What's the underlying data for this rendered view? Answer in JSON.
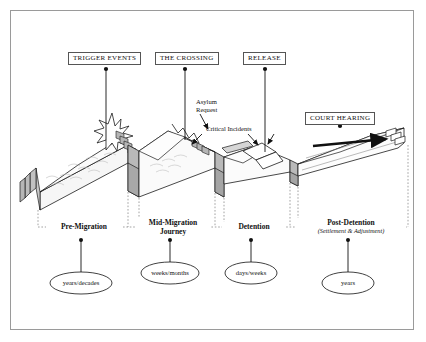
{
  "diagram": {
    "background_color": "#ffffff",
    "border_color": "#9a9a9a",
    "terrain_fill": "#f4f4f4",
    "wall_fill": "#b9b9b9",
    "line_color": "#1a1a1a"
  },
  "event_markers": [
    {
      "id": "trigger-events",
      "label": "TRIGGER EVENTS",
      "box_x": 68,
      "box_y": 52,
      "dot_x": 106,
      "dot_y": 68,
      "line_to_y": 140
    },
    {
      "id": "the-crossing",
      "label": "THE CROSSING",
      "box_x": 155,
      "box_y": 52,
      "dot_x": 185,
      "dot_y": 68,
      "line_to_y": 140
    },
    {
      "id": "release",
      "label": "RELEASE",
      "box_x": 243,
      "box_y": 52,
      "dot_x": 265,
      "dot_y": 68,
      "line_to_y": 152
    },
    {
      "id": "court-hearing",
      "label": "COURT HEARING",
      "box_x": 305,
      "box_y": 112,
      "dot_x": 340,
      "dot_y": 127,
      "line_to_y": 127
    }
  ],
  "annotations": [
    {
      "id": "asylum-request",
      "label_line1": "Asylum",
      "label_line2": "Request",
      "x": 196,
      "y": 100
    },
    {
      "id": "critical-incidents",
      "label_line1": "Critical Incidents",
      "label_line2": "",
      "x": 205,
      "y": 128
    }
  ],
  "phases": [
    {
      "id": "pre-migration",
      "label": "Pre-Migration",
      "label_line2": "",
      "sublabel": "",
      "center_x": 81,
      "label_y": 226,
      "start_x": 38,
      "end_x": 124
    },
    {
      "id": "mid-migration",
      "label": "Mid-Migration",
      "label_line2": "Journey",
      "sublabel": "",
      "center_x": 170,
      "label_y": 222,
      "start_x": 124,
      "end_x": 217
    },
    {
      "id": "detention",
      "label": "Detention",
      "label_line2": "",
      "sublabel": "",
      "center_x": 251,
      "label_y": 226,
      "start_x": 217,
      "end_x": 287
    },
    {
      "id": "post-detention",
      "label": "Post-Detention",
      "label_line2": "",
      "sublabel": "(Settlement & Adjustment)",
      "center_x": 348,
      "label_y": 222,
      "start_x": 287,
      "end_x": 408
    }
  ],
  "durations": [
    {
      "id": "pre-migration-duration",
      "label": "years/decades",
      "cx": 81,
      "cy": 283,
      "rx": 31,
      "ry": 11,
      "stem_from_y": 240
    },
    {
      "id": "mid-migration-duration",
      "label": "weeks/months",
      "cx": 170,
      "cy": 273,
      "rx": 29,
      "ry": 11,
      "stem_from_y": 240
    },
    {
      "id": "detention-duration",
      "label": "days/weeks",
      "cx": 251,
      "cy": 273,
      "rx": 26,
      "ry": 11,
      "stem_from_y": 240
    },
    {
      "id": "post-detention-duration",
      "label": "years",
      "cx": 348,
      "cy": 283,
      "rx": 26,
      "ry": 11,
      "stem_from_y": 240
    }
  ],
  "baseline": {
    "y": 227,
    "start_x": 38,
    "end_x": 408
  },
  "journey_arrow": {
    "from_x": 313,
    "to_x": 390,
    "y": 143,
    "color": "#111111"
  }
}
